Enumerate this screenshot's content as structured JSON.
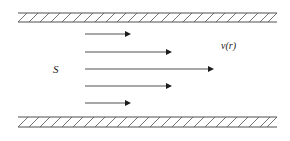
{
  "figure": {
    "canvas": {
      "width": 290,
      "height": 141,
      "background": "#ffffff"
    },
    "labels": {
      "cross_section": "S",
      "velocity_profile": "v(r)"
    },
    "walls": [
      {
        "name": "top-wall",
        "x_start": 18,
        "x_end": 277,
        "y_top": 13,
        "y_bottom": 22,
        "hatch_direction": "forward-slash",
        "hatch_spacing": 11,
        "color": "#3a3a3a"
      },
      {
        "name": "bottom-wall",
        "x_start": 18,
        "x_end": 277,
        "y_top": 117,
        "y_bottom": 127,
        "hatch_direction": "forward-slash",
        "hatch_spacing": 11,
        "color": "#3a3a3a"
      }
    ],
    "arrows": [
      {
        "name": "velocity-arrow-1",
        "x_start": 85,
        "x_end": 129,
        "y": 34,
        "length": 44
      },
      {
        "name": "velocity-arrow-2",
        "x_start": 85,
        "x_end": 170,
        "y": 52,
        "length": 85
      },
      {
        "name": "velocity-arrow-3",
        "x_start": 85,
        "x_end": 212,
        "y": 69,
        "length": 127
      },
      {
        "name": "velocity-arrow-4",
        "x_start": 85,
        "x_end": 170,
        "y": 86,
        "length": 85
      },
      {
        "name": "velocity-arrow-5",
        "x_start": 85,
        "x_end": 129,
        "y": 103,
        "length": 44
      }
    ],
    "label_positions": {
      "cross_section": {
        "x": 53,
        "y": 73
      },
      "velocity_profile": {
        "x": 221,
        "y": 49
      }
    },
    "colors": {
      "wall_outline": "#3a3a3a",
      "wall_hatch": "#5a5a5a",
      "arrow": "#2f2f2f",
      "arrow_head": "#1c1c1c",
      "text": "#1a1a1a",
      "background": "#ffffff"
    }
  }
}
